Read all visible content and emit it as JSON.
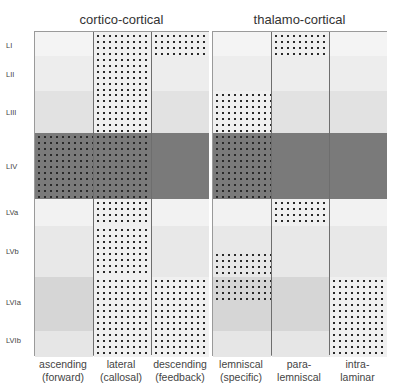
{
  "groups": [
    {
      "title": "cortico-cortical",
      "columns": [
        {
          "label_line1": "ascending",
          "label_line2": "(forward)",
          "dotted": [
            "LIV"
          ]
        },
        {
          "label_line1": "lateral",
          "label_line2": "(callosal)",
          "dotted": [
            "LI",
            "LII",
            "LIII",
            "LIV",
            "LVa",
            "LVb",
            "LVIa",
            "LVIb"
          ]
        },
        {
          "label_line1": "descending",
          "label_line2": "(feedback)",
          "dotted": [
            "LI",
            "LVIa",
            "LVIb"
          ]
        }
      ]
    },
    {
      "title": "thalamo-cortical",
      "columns": [
        {
          "label_line1": "lemniscal",
          "label_line2": "(specific)",
          "dotted": [
            "LIII",
            "LIV",
            "LVb-lower",
            "LVIa-upper"
          ]
        },
        {
          "label_line1": "para-",
          "label_line2": "lemniscal",
          "dotted": [
            "LI",
            "LVa"
          ]
        },
        {
          "label_line1": "intra-",
          "label_line2": "laminar",
          "dotted": [
            "LVIa",
            "LVIb"
          ]
        }
      ]
    }
  ],
  "layers": [
    {
      "label": "LI",
      "top": 0,
      "height": 24,
      "shade": "#f4f4f4"
    },
    {
      "label": "LII",
      "top": 24,
      "height": 35,
      "shade": "#ededed"
    },
    {
      "label": "LIII",
      "top": 59,
      "height": 42,
      "shade": "#e2e2e2"
    },
    {
      "label": "LIV",
      "top": 101,
      "height": 66,
      "shade": "#7a7a7a"
    },
    {
      "label": "LVa",
      "top": 167,
      "height": 27,
      "shade": "#f2f2f2"
    },
    {
      "label": "LVb",
      "top": 194,
      "height": 51,
      "shade": "#e8e8e8"
    },
    {
      "label": "LVIa",
      "top": 245,
      "height": 54,
      "shade": "#d6d6d6"
    },
    {
      "label": "LVIb",
      "top": 299,
      "height": 26,
      "shade": "#e6e6e6"
    }
  ],
  "colors": {
    "dot": "#2a2a2a",
    "border": "#6e6e6e",
    "layer4": "#7a7a7a"
  }
}
